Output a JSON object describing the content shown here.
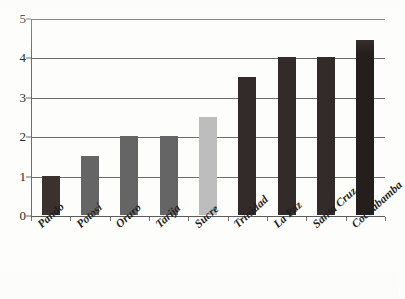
{
  "chart_data": {
    "type": "bar",
    "title": "",
    "subtitle": "",
    "xlabel": "",
    "ylabel": "",
    "categories": [
      "Pando",
      "Potosí",
      "Oruro",
      "Tarija",
      "Sucre",
      "Trinidad",
      "La Paz",
      "Santa Cruz",
      "Cochabamba"
    ],
    "values": [
      1,
      1.5,
      2,
      2,
      2.5,
      3.5,
      4,
      4,
      4.45
    ],
    "bar_colors": [
      "#3b3230",
      "#656565",
      "#656565",
      "#656565",
      "#bdbdbd",
      "#332b29",
      "#332b29",
      "#332b29",
      "#241e1d"
    ],
    "ylim": [
      0,
      5
    ],
    "yticks": [
      "0",
      "1",
      "2",
      "3",
      "4",
      "5"
    ],
    "ytick_values": [
      0,
      1,
      2,
      3,
      4,
      5
    ],
    "grid": "horizontal",
    "legend": "none",
    "annotations": []
  },
  "colors": {
    "background": "#fdfdfc",
    "gridline": "#6a6a6a",
    "axis": "#6d6d6d",
    "dark_bar": "#332b29",
    "medium_bar": "#656565",
    "light_bar": "#bdbdbd",
    "tick_text": "#2a2a2a",
    "label_text": "#1f1f1f"
  }
}
